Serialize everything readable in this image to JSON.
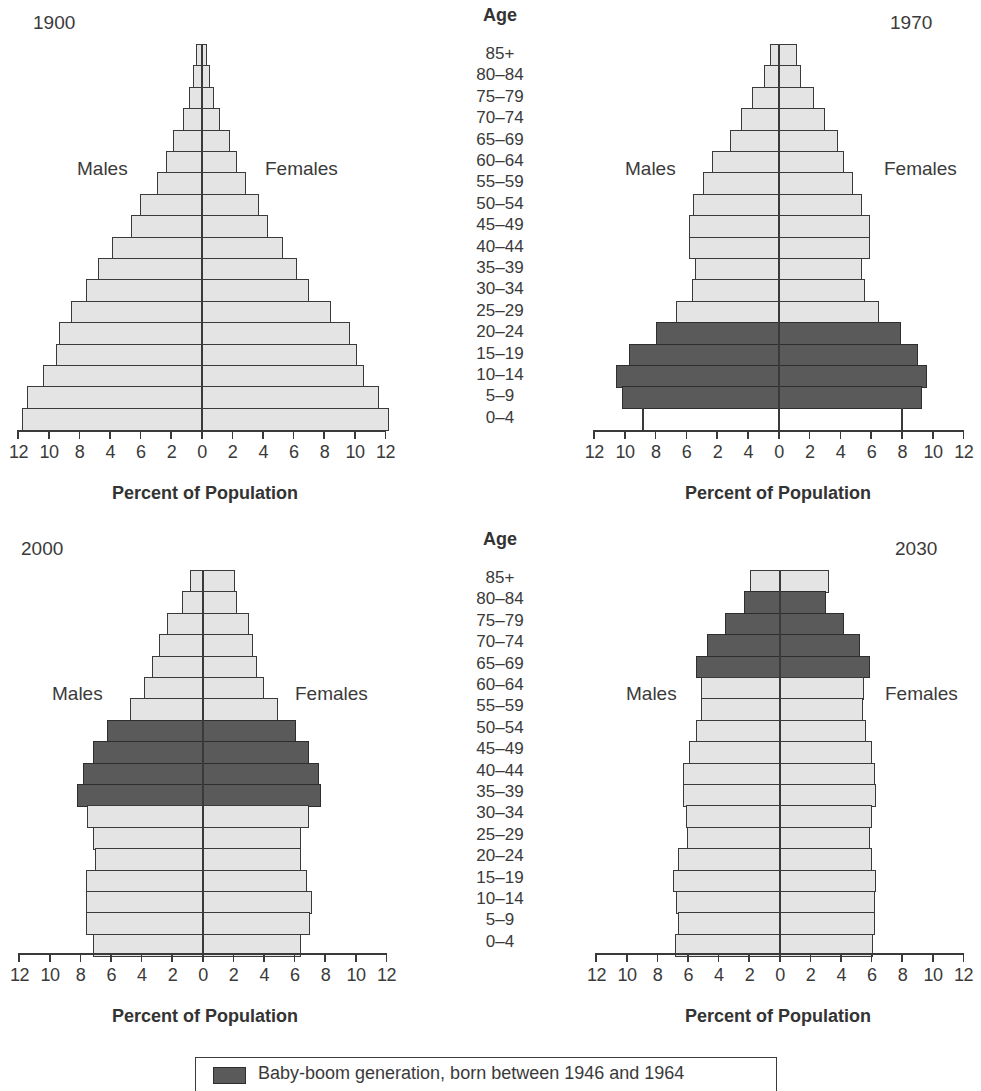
{
  "age_header": "Age",
  "age_groups": [
    "85+",
    "80–84",
    "75–79",
    "70–74",
    "65–69",
    "60–64",
    "55–59",
    "50–54",
    "45–49",
    "40–44",
    "35–39",
    "30–34",
    "25–29",
    "20–24",
    "15–19",
    "10–14",
    "5–9",
    "0–4"
  ],
  "males_label": "Males",
  "females_label": "Females",
  "x_title": "Percent of Population",
  "legend": {
    "label": "Baby-boom generation, born between 1946 and 1964",
    "color": "#5a5a5a"
  },
  "colors": {
    "bar_fill": "#e4e4e4",
    "baby_boom_fill": "#5a5a5a",
    "outline": "#3a3a3a",
    "background": "#ffffff"
  },
  "panels": [
    {
      "year": "1900",
      "tick_labels": [
        "12",
        "10",
        "8",
        "4",
        "6",
        "2",
        "0",
        "2",
        "4",
        "6",
        "8",
        "10",
        "12"
      ]
    },
    {
      "year": "1970",
      "tick_labels": [
        "12",
        "10",
        "8",
        "6",
        "2",
        "4",
        "0",
        "2",
        "4",
        "6",
        "8",
        "10",
        "12"
      ]
    },
    {
      "year": "2000",
      "tick_labels": [
        "12",
        "10",
        "8",
        "6",
        "4",
        "2",
        "0",
        "2",
        "4",
        "6",
        "8",
        "10",
        "12"
      ]
    },
    {
      "year": "2030",
      "tick_labels": [
        "12",
        "10",
        "8",
        "6",
        "4",
        "2",
        "0",
        "2",
        "4",
        "6",
        "8",
        "10",
        "12"
      ]
    }
  ],
  "chart_data": [
    {
      "type": "bar",
      "subtype": "population-pyramid",
      "title": "1900",
      "categories": [
        "85+",
        "80–84",
        "75–79",
        "70–74",
        "65–69",
        "60–64",
        "55–59",
        "50–54",
        "45–49",
        "40–44",
        "35–39",
        "30–34",
        "25–29",
        "20–24",
        "15–19",
        "10–14",
        "5–9",
        "0–4"
      ],
      "series": [
        {
          "name": "Males",
          "values": [
            0.3,
            0.5,
            0.8,
            1.2,
            1.8,
            2.3,
            2.9,
            4.0,
            4.6,
            5.8,
            6.7,
            7.5,
            8.5,
            9.3,
            9.5,
            10.3,
            11.4,
            11.7
          ]
        },
        {
          "name": "Females",
          "values": [
            0.3,
            0.5,
            0.8,
            1.2,
            1.8,
            2.3,
            2.9,
            3.7,
            4.3,
            5.3,
            6.2,
            7.0,
            8.4,
            9.7,
            10.1,
            10.6,
            11.6,
            12.2
          ]
        }
      ],
      "baby_boom_groups": [],
      "xlabel": "Percent of Population",
      "ylabel": "Age",
      "xlim": [
        -12,
        12
      ],
      "grid": false
    },
    {
      "type": "bar",
      "subtype": "population-pyramid",
      "title": "1970",
      "categories": [
        "85+",
        "80–84",
        "75–79",
        "70–74",
        "65–69",
        "60–64",
        "55–59",
        "50–54",
        "45–49",
        "40–44",
        "35–39",
        "30–34",
        "25–29",
        "20–24",
        "15–19",
        "10–14",
        "5–9",
        "0–4"
      ],
      "series": [
        {
          "name": "Males",
          "values": [
            0.5,
            0.9,
            1.7,
            2.4,
            3.1,
            4.3,
            4.9,
            5.5,
            5.8,
            5.8,
            5.4,
            5.6,
            6.6,
            7.9,
            9.7,
            10.5,
            10.1,
            8.8
          ]
        },
        {
          "name": "Females",
          "values": [
            1.2,
            1.4,
            2.3,
            3.0,
            3.8,
            4.2,
            4.8,
            5.4,
            5.9,
            5.9,
            5.4,
            5.6,
            6.5,
            7.9,
            9.0,
            9.6,
            9.3,
            8.0
          ]
        }
      ],
      "baby_boom_groups": [
        "20–24",
        "15–19",
        "10–14",
        "5–9"
      ],
      "xlabel": "Percent of Population",
      "ylabel": "Age",
      "xlim": [
        -12,
        12
      ],
      "grid": false
    },
    {
      "type": "bar",
      "subtype": "population-pyramid",
      "title": "2000",
      "categories": [
        "85+",
        "80–84",
        "75–79",
        "70–74",
        "65–69",
        "60–64",
        "55–59",
        "50–54",
        "45–49",
        "40–44",
        "35–39",
        "30–34",
        "25–29",
        "20–24",
        "15–19",
        "10–14",
        "5–9",
        "0–4"
      ],
      "series": [
        {
          "name": "Males",
          "values": [
            0.8,
            1.3,
            2.3,
            2.8,
            3.3,
            3.8,
            4.7,
            6.2,
            7.1,
            7.8,
            8.2,
            7.5,
            7.1,
            7.0,
            7.6,
            7.6,
            7.6,
            7.1
          ]
        },
        {
          "name": "Females",
          "values": [
            2.1,
            2.2,
            3.0,
            3.3,
            3.5,
            4.0,
            4.9,
            6.1,
            6.9,
            7.6,
            7.7,
            6.9,
            6.4,
            6.4,
            6.8,
            7.1,
            7.0,
            6.4
          ]
        }
      ],
      "baby_boom_groups": [
        "50–54",
        "45–49",
        "40–44",
        "35–39"
      ],
      "xlabel": "Percent of Population",
      "ylabel": "Age",
      "xlim": [
        -12,
        12
      ],
      "grid": false
    },
    {
      "type": "bar",
      "subtype": "population-pyramid",
      "title": "2030",
      "categories": [
        "85+",
        "80–84",
        "75–79",
        "70–74",
        "65–69",
        "60–64",
        "55–59",
        "50–54",
        "45–49",
        "40–44",
        "35–39",
        "30–34",
        "25–29",
        "20–24",
        "15–19",
        "10–14",
        "5–9",
        "0–4"
      ],
      "series": [
        {
          "name": "Males",
          "values": [
            1.9,
            2.3,
            3.5,
            4.7,
            5.4,
            5.1,
            5.1,
            5.4,
            5.9,
            6.3,
            6.3,
            6.1,
            6.0,
            6.6,
            6.9,
            6.7,
            6.6,
            6.8
          ]
        },
        {
          "name": "Females",
          "values": [
            3.2,
            3.0,
            4.2,
            5.2,
            5.9,
            5.5,
            5.4,
            5.6,
            6.0,
            6.2,
            6.3,
            6.0,
            5.9,
            6.0,
            6.3,
            6.2,
            6.2,
            6.1
          ]
        }
      ],
      "baby_boom_groups": [
        "80–84",
        "75–79",
        "70–74",
        "65–69"
      ],
      "xlabel": "Percent of Population",
      "ylabel": "Age",
      "xlim": [
        -12,
        12
      ],
      "grid": false
    }
  ]
}
